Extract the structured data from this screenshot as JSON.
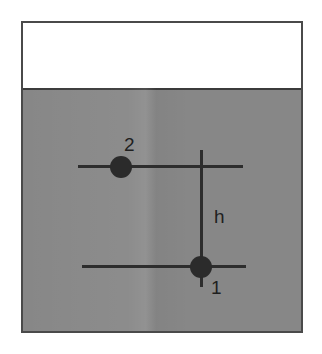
{
  "figure": {
    "kind": "fluid-statics-diagram",
    "canvas": {
      "width": 322,
      "height": 354,
      "background": "#ffffff"
    },
    "vessel": {
      "name": "container",
      "border_color": "#4a4a4a",
      "interior_color": "#ffffff",
      "x": 21,
      "y": 21,
      "width": 282,
      "height": 312
    },
    "fluid": {
      "name": "fluid-body",
      "fill_color": "#878787",
      "surface_line_color": "#3b3b3b",
      "surface_y": 89,
      "depth_px": 243
    },
    "points": [
      {
        "id": "point-2",
        "label": "2",
        "dot_color": "#2b2b2b",
        "center_x": 121,
        "center_y": 167,
        "radius": 11,
        "label_x": 124,
        "label_y": 135
      },
      {
        "id": "point-1",
        "label": "1",
        "dot_color": "#2b2b2b",
        "center_x": 201,
        "center_y": 267,
        "radius": 11,
        "label_x": 211,
        "label_y": 278
      }
    ],
    "streamlines": [
      {
        "id": "streamline-upper",
        "y": 166,
        "x1": 78,
        "x2": 243,
        "color": "#2d2d2d"
      },
      {
        "id": "streamline-lower",
        "y": 266,
        "x1": 82,
        "x2": 246,
        "color": "#2d2d2d"
      }
    ],
    "height_marker": {
      "id": "height-h",
      "label": "h",
      "x": 200,
      "y_top": 150,
      "y_bottom": 287,
      "color": "#2d2d2d",
      "label_x": 214,
      "label_y": 207
    }
  }
}
